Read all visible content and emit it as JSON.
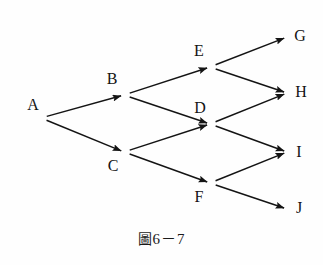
{
  "figure": {
    "caption": "圖 6－7",
    "caption_prefix": "圖",
    "caption_number": "6－7",
    "background_color": "#fefefe",
    "stroke_color": "#141414",
    "label_color": "#141414"
  },
  "chart_data": {
    "type": "diagram",
    "subtype": "directed-graph",
    "grid": false,
    "legend": null,
    "xlim": [
      0,
      323
    ],
    "ylim": [
      0,
      265
    ],
    "nodes": [
      {
        "id": "A",
        "label": "A",
        "x": 41,
        "y": 118,
        "label_x": 33,
        "label_y": 105
      },
      {
        "id": "B",
        "label": "B",
        "x": 124,
        "y": 95,
        "label_x": 112,
        "label_y": 79
      },
      {
        "id": "C",
        "label": "C",
        "x": 124,
        "y": 152,
        "label_x": 113,
        "label_y": 166
      },
      {
        "id": "D",
        "label": "D",
        "x": 210,
        "y": 124,
        "label_x": 200,
        "label_y": 108
      },
      {
        "id": "E",
        "label": "E",
        "x": 210,
        "y": 67,
        "label_x": 199,
        "label_y": 51
      },
      {
        "id": "F",
        "label": "F",
        "x": 210,
        "y": 183,
        "label_x": 199,
        "label_y": 197
      },
      {
        "id": "G",
        "label": "G",
        "x": 287,
        "y": 37,
        "label_x": 300,
        "label_y": 36
      },
      {
        "id": "H",
        "label": "H",
        "x": 287,
        "y": 93,
        "label_x": 301,
        "label_y": 92
      },
      {
        "id": "I",
        "label": "I",
        "x": 287,
        "y": 152,
        "label_x": 299,
        "label_y": 152
      },
      {
        "id": "J",
        "label": "J",
        "x": 287,
        "y": 209,
        "label_x": 299,
        "label_y": 208
      }
    ],
    "edges": [
      {
        "from": "A",
        "to": "B"
      },
      {
        "from": "A",
        "to": "C"
      },
      {
        "from": "B",
        "to": "E"
      },
      {
        "from": "B",
        "to": "D"
      },
      {
        "from": "C",
        "to": "D"
      },
      {
        "from": "C",
        "to": "F"
      },
      {
        "from": "E",
        "to": "G"
      },
      {
        "from": "E",
        "to": "H"
      },
      {
        "from": "D",
        "to": "H"
      },
      {
        "from": "D",
        "to": "I"
      },
      {
        "from": "F",
        "to": "I"
      },
      {
        "from": "F",
        "to": "J"
      }
    ],
    "node_count": 10,
    "edge_count": 12
  }
}
